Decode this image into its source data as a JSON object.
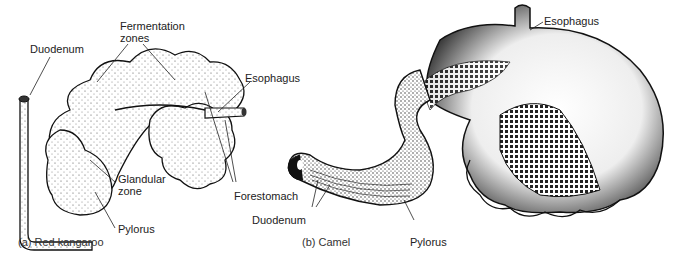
{
  "figure": {
    "panels": [
      {
        "id": "a",
        "caption": "(a) Red kangaroo",
        "labels": {
          "duodenum": "Duodenum",
          "fermentation_zones_line1": "Fermentation",
          "fermentation_zones_line2": "zones",
          "esophagus": "Esophagus",
          "glandular_zone_line1": "Glandular",
          "glandular_zone_line2": "zone",
          "forestomach": "Forestomach",
          "pylorus": "Pylorus"
        }
      },
      {
        "id": "b",
        "caption": "(b) Camel",
        "labels": {
          "esophagus": "Esophagus",
          "duodenum": "Duodenum",
          "pylorus": "Pylorus"
        }
      }
    ]
  }
}
